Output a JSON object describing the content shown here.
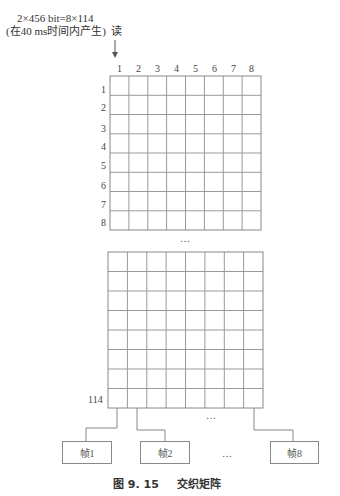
{
  "header": {
    "line1": "2×456 bit=8×114",
    "line2": "(在40 ms时间内产生)",
    "read_label": "读"
  },
  "matrix": {
    "column_labels": [
      "1",
      "2",
      "3",
      "4",
      "5",
      "6",
      "7",
      "8"
    ],
    "top_row_labels": [
      "1",
      "2",
      "3",
      "4",
      "5",
      "6",
      "7",
      "8"
    ],
    "last_row_label": "114",
    "ellipsis_between": "…",
    "ellipsis_columns": "…"
  },
  "frames": {
    "items": [
      "帧1",
      "帧2",
      "帧8"
    ],
    "ellipsis": "…"
  },
  "caption": {
    "number": "图 9. 15",
    "title": "交织矩阵"
  }
}
